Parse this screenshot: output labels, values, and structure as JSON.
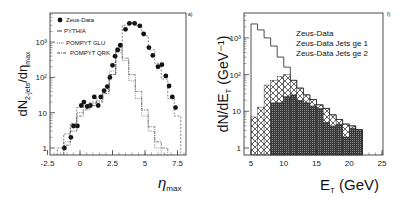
{
  "chart_data": [
    {
      "type": "scatter",
      "panel_tag": "a)",
      "ylabel_main": "dN",
      "ylabel_sub": "2-jets",
      "ylabel_den": "/dη",
      "ylabel_den_sub": "max",
      "xlabel_main": "η",
      "xlabel_sub": "max",
      "yscale": "log",
      "xlim": [
        -2.5,
        8.5
      ],
      "ylim": [
        0.6,
        6000
      ],
      "xticks": [
        "-2.5",
        "0",
        "2.5",
        "5",
        "7.5"
      ],
      "xtick_values": [
        -2.5,
        0,
        2.5,
        5,
        7.5
      ],
      "yticks": [
        "1",
        "10",
        "10²",
        "10³"
      ],
      "ytick_values": [
        1,
        10,
        100,
        1000
      ],
      "legend": [
        "Zeus-Data",
        "PYTHIA",
        "POMPYT GLU",
        "POMPYT QRK"
      ],
      "legend_position": "top-left",
      "series": [
        {
          "name": "Zeus-Data",
          "style": "points",
          "x": [
            -1.2,
            -0.7,
            -0.5,
            -0.2,
            0.1,
            0.3,
            0.55,
            0.8,
            1.1,
            1.4,
            1.6,
            1.85,
            2.1,
            2.3,
            2.5,
            2.7,
            2.9,
            3.1,
            3.5,
            3.8,
            4.2,
            4.6,
            4.9,
            5.3,
            5.6,
            6.0,
            6.3,
            6.6,
            6.85,
            7.1,
            7.35
          ],
          "y": [
            1,
            2,
            4.2,
            4.2,
            16,
            20,
            15,
            16,
            28,
            16,
            28,
            42,
            55,
            100,
            220,
            400,
            600,
            820,
            2300,
            3400,
            3400,
            2900,
            1700,
            700,
            420,
            200,
            230,
            110,
            57,
            28,
            14
          ]
        },
        {
          "name": "PYTHIA",
          "style": "dashed-step",
          "x": [
            -1.5,
            -1,
            -0.5,
            0,
            0.5,
            1,
            1.5,
            2,
            2.5,
            3,
            3.5,
            4,
            4.5,
            5,
            5.5,
            6,
            6.5,
            7,
            7.5
          ],
          "y": [
            1,
            2.5,
            5,
            14,
            16,
            20,
            25,
            45,
            120,
            600,
            3000,
            3600,
            3000,
            1500,
            600,
            250,
            90,
            25,
            8
          ]
        },
        {
          "name": "POMPYT GLU",
          "style": "dotted-step",
          "x": [
            -1,
            -0.5,
            0,
            0.5,
            1,
            1.5,
            2,
            2.5,
            3,
            3.5,
            4,
            4.5,
            5,
            5.5,
            6
          ],
          "y": [
            1.5,
            4,
            10,
            14,
            18,
            22,
            40,
            150,
            500,
            300,
            80,
            25,
            8,
            3,
            1
          ]
        },
        {
          "name": "POMPYT QRK",
          "style": "dashdot-step",
          "x": [
            -1,
            -0.5,
            0,
            0.5,
            1,
            1.5,
            2,
            2.5,
            3,
            3.5,
            4,
            4.5,
            5,
            5.5,
            6,
            6.5
          ],
          "y": [
            1.2,
            3,
            8,
            12,
            16,
            20,
            35,
            120,
            700,
            350,
            120,
            40,
            12,
            4,
            1.5,
            1
          ]
        }
      ]
    },
    {
      "type": "bar",
      "panel_tag": "f)",
      "ylabel_main": "dN/dE",
      "ylabel_sub": "T",
      "ylabel_unit": " (GeV⁻¹)",
      "xlabel_main": "E",
      "xlabel_sub": "T",
      "xlabel_unit": " (GeV)",
      "yscale": "log",
      "xlim": [
        5,
        25
      ],
      "ylim": [
        0.6,
        6000
      ],
      "xticks": [
        "5",
        "10",
        "15",
        "20",
        "25"
      ],
      "xtick_values": [
        5,
        10,
        15,
        20,
        25
      ],
      "yticks": [
        "1",
        "10",
        "10²",
        "10³"
      ],
      "ytick_values": [
        1,
        10,
        100,
        1000
      ],
      "legend": [
        "Zeus-Data",
        "Zeus-Data  Jets ge 1",
        "Zeus-Data  Jets ge 2"
      ],
      "legend_position": "top-right",
      "bin_edges": [
        5,
        6,
        7,
        8,
        9,
        10,
        11,
        12,
        13,
        14,
        15,
        16,
        17,
        18,
        19,
        20,
        21,
        22
      ],
      "series": [
        {
          "name": "Zeus-Data",
          "style": "outline",
          "values": [
            2400,
            1650,
            1000,
            600,
            300,
            160,
            70,
            43,
            28,
            21,
            15,
            12,
            8,
            6,
            4.5,
            4,
            3.2
          ]
        },
        {
          "name": "Zeus-Data Jets ge 1",
          "style": "crosshatch",
          "values": [
            7,
            13,
            52,
            70,
            90,
            100,
            70,
            43,
            28,
            21,
            15,
            12,
            8,
            6,
            4.5,
            4,
            3.2
          ]
        },
        {
          "name": "Zeus-Data Jets ge 2",
          "style": "dark",
          "values": [
            0,
            0,
            0,
            17,
            17,
            25,
            28,
            20,
            17,
            14,
            12,
            5,
            4,
            4.5,
            2,
            3.5,
            3
          ]
        }
      ]
    }
  ]
}
